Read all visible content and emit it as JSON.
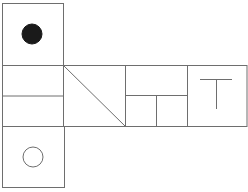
{
  "diagram": {
    "type": "cube-net",
    "stroke_color": "#6e6e6e",
    "fill_dark": "#1a1a1a",
    "faces": [
      {
        "id": "top",
        "symbol": "filled-circle"
      },
      {
        "id": "middle-1",
        "symbol": "horizontal-split"
      },
      {
        "id": "middle-2",
        "symbol": "diagonal-line"
      },
      {
        "id": "middle-3",
        "symbol": "inverted-T-split"
      },
      {
        "id": "middle-4",
        "symbol": "T-letter"
      },
      {
        "id": "bottom",
        "symbol": "open-circle"
      }
    ]
  }
}
